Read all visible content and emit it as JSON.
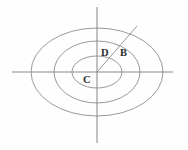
{
  "figure": {
    "canvas": {
      "width": 188,
      "height": 150,
      "background": "#fefefe"
    },
    "colors": {
      "stroke": "#8d8d8d",
      "axis": "#8a8a8a",
      "label": "#2e2e2e",
      "background": "#fefefe"
    },
    "center": {
      "x": 97,
      "y": 72
    },
    "ellipses": [
      {
        "name": "inner-ellipse",
        "cx": 97,
        "cy": 72,
        "rx": 25,
        "ry": 16
      },
      {
        "name": "middle-ellipse",
        "cx": 97,
        "cy": 72,
        "rx": 43,
        "ry": 31
      },
      {
        "name": "outer-ellipse",
        "cx": 97,
        "cy": 72,
        "rx": 66,
        "ry": 44
      }
    ],
    "axes": {
      "horizontal": {
        "x1": 12,
        "y1": 72,
        "x2": 173,
        "y2": 72
      },
      "vertical": {
        "x1": 97,
        "y1": 7,
        "x2": 97,
        "y2": 143
      }
    },
    "radius_segment": {
      "x1": 97,
      "y1": 72,
      "x2": 137,
      "y2": 26
    },
    "labels": [
      {
        "name": "label-d",
        "text": "D",
        "x": 101,
        "y": 56
      },
      {
        "name": "label-b",
        "text": "B",
        "x": 120,
        "y": 56
      },
      {
        "name": "label-c",
        "text": "C",
        "x": 83,
        "y": 83
      }
    ],
    "artifacts": {
      "top_bleed_text": "• · •· • ·· • · •·• · • ·· • · • ·• ·•",
      "bottom_bleed_text": "· • ·· • · • ·• · •· · • ·• ·"
    }
  }
}
